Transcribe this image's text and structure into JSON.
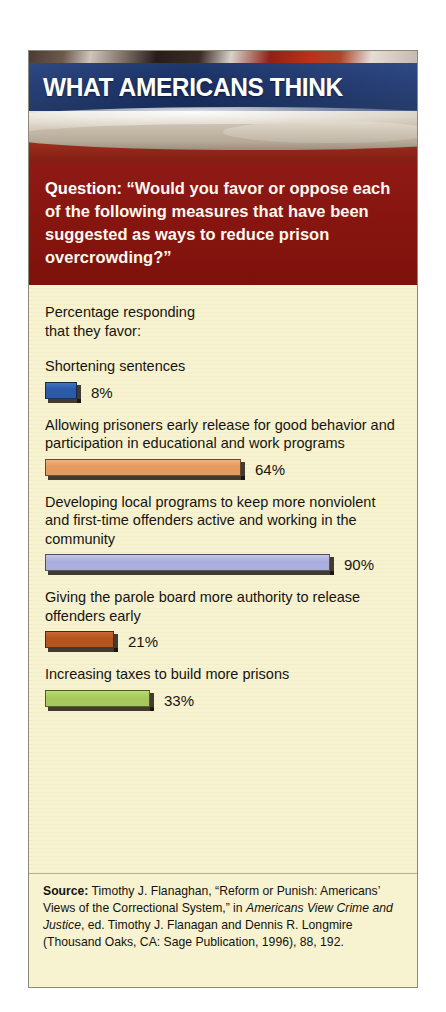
{
  "card": {
    "header_title": "WHAT AMERICANS THINK",
    "question_label": "Question:",
    "question_text": "“Would you favor or oppose each of the following measures that have been suggested as ways to reduce prison overcrowding?”",
    "intro_line1": "Percentage responding",
    "intro_line2": "that they favor:"
  },
  "chart_data": {
    "type": "bar",
    "title": "WHAT AMERICANS THINK",
    "subtitle": "Percentage responding that they favor:",
    "question": "“Would you favor or oppose each of the following measures that have been suggested as ways to reduce prison overcrowding?”",
    "xlabel": "",
    "ylabel": "",
    "xlim": [
      0,
      100
    ],
    "grid": false,
    "legend": "none",
    "orientation": "horizontal",
    "unit": "%",
    "categories": [
      "Shortening sentences",
      "Allowing prisoners early release for good behavior and participation in educational and work programs",
      "Developing local programs to keep more nonviolent and first-time offenders active and working in the community",
      "Giving the parole board more authority to release offenders early",
      "Increasing taxes to build more prisons"
    ],
    "values": [
      8,
      33,
      90,
      21,
      33
    ],
    "bars": [
      {
        "label": "Shortening sentences",
        "value": 8,
        "value_label": "8%",
        "color": "#2b5aa8",
        "color_top": "#3f72c4",
        "width_px": 32
      },
      {
        "label": "Allowing prisoners early release for good behavior and participation in educational and work programs",
        "value": 64,
        "value_label": "64%",
        "color": "#e59a5e",
        "color_top": "#f0b27e",
        "width_px": 196
      },
      {
        "label": "Developing local programs to keep more nonviolent and first-time offenders active and working in the community",
        "value": 90,
        "value_label": "90%",
        "color": "#a9aedd",
        "color_top": "#c2c6ea",
        "width_px": 285
      },
      {
        "label": "Giving the parole board more authority to release offenders early",
        "value": 21,
        "value_label": "21%",
        "color": "#b4551f",
        "color_top": "#c96a32",
        "width_px": 69
      },
      {
        "label": "Increasing taxes to build more prisons",
        "value": 33,
        "value_label": "33%",
        "color": "#a6c85c",
        "color_top": "#badc74",
        "width_px": 105
      }
    ]
  },
  "source": {
    "label": "Source:",
    "line1": " Timothy J. Flanaghan, “Reform or Punish:",
    "line2": "Americans’ Views of the Correctional System,” in",
    "italic": "Americans View Crime and Justice",
    "line3": ", ed. Timothy J.",
    "line4": "Flanagan and Dennis R. Longmire (Thousand Oaks, CA:",
    "line5": "Sage Publication, 1996), 88, 192."
  },
  "colors": {
    "band_red": "#87150f",
    "flag_blue": "#1c3570",
    "paper": "#f7f2cf",
    "text": "#14120f"
  }
}
